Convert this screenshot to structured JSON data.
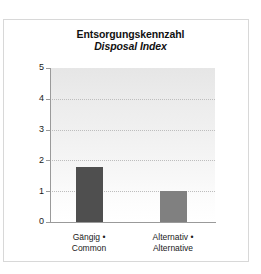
{
  "chart_data": {
    "type": "bar",
    "title": "Entsorgungskennzahl",
    "subtitle": "Disposal Index",
    "categories": [
      "Gängig •\nCommon",
      "Alternativ •\nAlternative"
    ],
    "category_lines": [
      {
        "line1": "Gängig •",
        "line2": "Common"
      },
      {
        "line1": "Alternativ •",
        "line2": "Alternative"
      }
    ],
    "values": [
      1.8,
      1.0
    ],
    "xlabel": "",
    "ylabel": "",
    "ylim": [
      0,
      5
    ],
    "ytick_labels": [
      "0",
      "1",
      "2",
      "3",
      "4",
      "5"
    ],
    "ytick_values": [
      0,
      1,
      2,
      3,
      4,
      5
    ],
    "gridlines": [
      1,
      2,
      3,
      4
    ],
    "grid": true,
    "legend": "none",
    "bar_colors": [
      "#4f4f4f",
      "#808080"
    ],
    "plot_background": "#ececec",
    "axis_color": "#9a9a9a",
    "grid_color": "#bdbdbd",
    "frame_color": "#d8d8d8",
    "text_color": "#111111"
  }
}
